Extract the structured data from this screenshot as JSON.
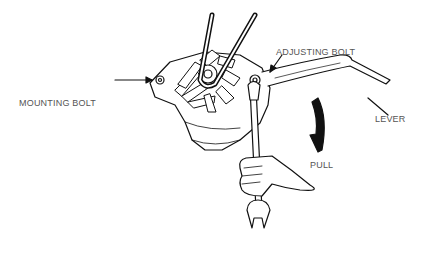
{
  "diagram": {
    "labels": {
      "mounting_bolt": "MOUNTING BOLT",
      "adjusting_bolt": "ADJUSTING BOLT",
      "lever": "LEVER",
      "pull": "PULL"
    },
    "colors": {
      "line": "#111111",
      "text": "#555555",
      "background": "#ffffff"
    }
  }
}
